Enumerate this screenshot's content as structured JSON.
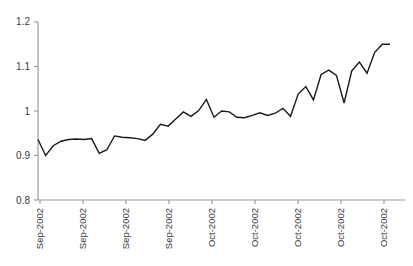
{
  "chart_data": {
    "type": "line",
    "title": "",
    "xlabel": "",
    "ylabel": "",
    "ylim": [
      0.8,
      1.2
    ],
    "ytick_labels": [
      "1.2",
      "1.1",
      "1",
      "0.9",
      "0.8"
    ],
    "ytick_values": [
      1.2,
      1.1,
      1.0,
      0.9,
      0.8
    ],
    "grid": false,
    "legend": "none",
    "xtick_labels": [
      "Sep-2002",
      "Sep-2002",
      "Sep-2002",
      "Sep-2002",
      "Oct-2002",
      "Oct-2002",
      "Oct-2002",
      "Oct-2002",
      "Oct-2002"
    ],
    "line_color": "#1a1a1a",
    "axis_color": "#9a9a9a",
    "series": [
      {
        "name": "index",
        "values": [
          0.936,
          0.9,
          0.922,
          0.932,
          0.936,
          0.937,
          0.936,
          0.938,
          0.905,
          0.913,
          0.944,
          0.941,
          0.94,
          0.938,
          0.934,
          0.948,
          0.97,
          0.966,
          0.982,
          0.998,
          0.988,
          1.001,
          1.026,
          0.986,
          1.0,
          0.998,
          0.986,
          0.985,
          0.99,
          0.996,
          0.99,
          0.995,
          1.006,
          0.988,
          1.038,
          1.055,
          1.025,
          1.082,
          1.092,
          1.08,
          1.018,
          1.09,
          1.11,
          1.085,
          1.132,
          1.15,
          1.15
        ]
      }
    ]
  }
}
